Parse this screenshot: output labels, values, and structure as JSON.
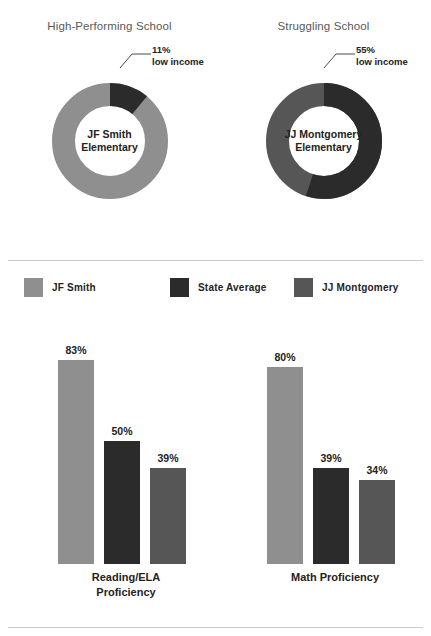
{
  "colors": {
    "jf_smith": "#8f8f8f",
    "state_average": "#2b2b2b",
    "jj_montgomery": "#565656",
    "title": "#595959",
    "rule": "#c9c9c9",
    "text": "#232323",
    "background": "#ffffff"
  },
  "donuts": [
    {
      "title": "High-Performing School",
      "center_line1": "JF Smith",
      "center_line2": "Elementary",
      "callout_value": "11%",
      "callout_label": "low income",
      "low_income_pct": 11,
      "remainder_pct": 89,
      "low_income_color": "#2b2b2b",
      "remainder_color": "#8f8f8f"
    },
    {
      "title": "Struggling School",
      "center_line1": "JJ Montgomery",
      "center_line2": "Elementary",
      "callout_value": "55%",
      "callout_label": "low income",
      "low_income_pct": 55,
      "remainder_pct": 45,
      "low_income_color": "#2b2b2b",
      "remainder_color": "#565656"
    }
  ],
  "legend": [
    {
      "label": "JF Smith",
      "color": "#8f8f8f"
    },
    {
      "label": "State Average",
      "color": "#2b2b2b"
    },
    {
      "label": "JJ Montgomery",
      "color": "#565656"
    }
  ],
  "chart_data": {
    "type": "bar",
    "title": "",
    "xlabel": "",
    "ylabel": "",
    "ylim": [
      0,
      100
    ],
    "grid": false,
    "legend_position": "top",
    "categories": [
      "Reading/ELA Proficiency",
      "Math Proficiency"
    ],
    "category_labels": [
      {
        "line1": "Reading/ELA",
        "line2": "Proficiency"
      },
      {
        "line1": "Math Proficiency",
        "line2": ""
      }
    ],
    "series": [
      {
        "name": "JF Smith",
        "color": "#8f8f8f",
        "values": [
          83,
          80
        ],
        "value_labels": [
          "83%",
          "80%"
        ]
      },
      {
        "name": "State Average",
        "color": "#2b2b2b",
        "values": [
          50,
          39
        ],
        "value_labels": [
          "50%",
          "39%"
        ]
      },
      {
        "name": "JJ Montgomery",
        "color": "#565656",
        "values": [
          39,
          34
        ],
        "value_labels": [
          "39%",
          "34%"
        ]
      }
    ]
  },
  "donut_chart_data": {
    "type": "pie",
    "variant": "donut",
    "title": "Low income student share",
    "charts": [
      {
        "name": "JF Smith Elementary",
        "labels": [
          "low income",
          "other"
        ],
        "values": [
          11,
          89
        ],
        "colors": [
          "#2b2b2b",
          "#8f8f8f"
        ]
      },
      {
        "name": "JJ Montgomery Elementary",
        "labels": [
          "low income",
          "other"
        ],
        "values": [
          55,
          45
        ],
        "colors": [
          "#2b2b2b",
          "#565656"
        ]
      }
    ]
  }
}
